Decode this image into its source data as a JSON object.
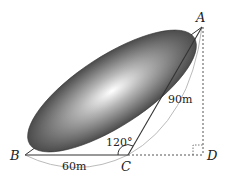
{
  "diagram": {
    "points": {
      "A": {
        "label": "A",
        "x": 202,
        "y": 27
      },
      "B": {
        "label": "B",
        "x": 25,
        "y": 155
      },
      "C": {
        "label": "C",
        "x": 128,
        "y": 155
      },
      "D": {
        "label": "D",
        "x": 203,
        "y": 155
      }
    },
    "measurements": {
      "BC": "60m",
      "AC": "90m",
      "angle_BCA": "120°"
    },
    "colors": {
      "ellipse_dark": "#3a3a3a",
      "ellipse_light": "#ffffff",
      "line": "#333333",
      "arc": "#bbbbbb"
    }
  }
}
